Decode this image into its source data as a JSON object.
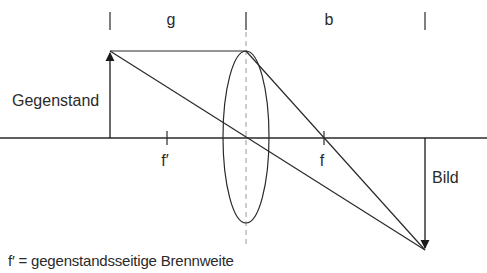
{
  "diagram": {
    "labels": {
      "object_distance": "g",
      "image_distance": "b",
      "object": "Gegenstand",
      "image": "Bild",
      "focal_object_side": "f′",
      "focal_image_side": "f"
    },
    "caption": "f′ = gegenstandsseitige Brennweite",
    "colors": {
      "line": "#2a2a2a",
      "dashed": "#9a9a9a",
      "background": "#ffffff"
    }
  }
}
